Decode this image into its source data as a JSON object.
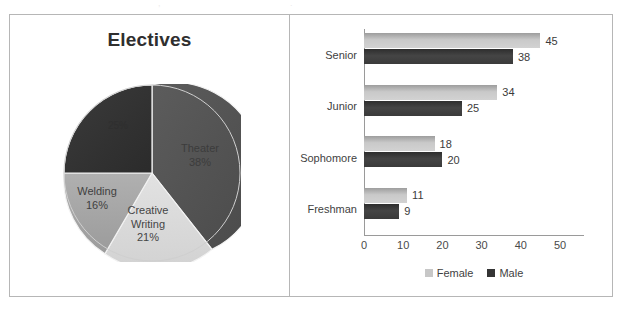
{
  "ghost_text": {
    "left": ",",
    "right": "."
  },
  "pie_panel": {
    "title": "Electives",
    "slices": [
      {
        "label": "Theater",
        "percent_text": "38%"
      },
      {
        "label": "Creative Writing",
        "label_line1": "Creative",
        "label_line2": "Writing",
        "percent_text": "21%"
      },
      {
        "label": "Welding",
        "percent_text": "16%"
      },
      {
        "label": "",
        "percent_text": "25%"
      }
    ]
  },
  "bar_panel": {
    "legend": [
      {
        "name": "Female",
        "color": "#c7c7c7"
      },
      {
        "name": "Male",
        "color": "#343434"
      }
    ],
    "xticks": [
      "0",
      "10",
      "20",
      "30",
      "40",
      "50"
    ]
  },
  "chart_data": [
    {
      "type": "pie",
      "title": "Electives",
      "labels": [
        "Theater",
        "Creative Writing",
        "Welding",
        "Band"
      ],
      "values": [
        38,
        21,
        16,
        25
      ],
      "value_suffix": "%",
      "label_texts": [
        "Theater 38%",
        "Creative Writing 21%",
        "Welding 16%",
        "25%"
      ],
      "colors": [
        "#535353",
        "#d9d9d9",
        "#a6a6a6",
        "#333333"
      ],
      "notes": "Fourth (darkest) slice label is illegible in the source image; it occupies the remaining 25%.",
      "legend": "none",
      "start_angle_deg": 0,
      "direction": "clockwise"
    },
    {
      "type": "bar",
      "orientation": "horizontal",
      "categories": [
        "Senior",
        "Junior",
        "Sophomore",
        "Freshman"
      ],
      "series": [
        {
          "name": "Female",
          "values": [
            45,
            34,
            18,
            11
          ],
          "color": "#c9c9c9"
        },
        {
          "name": "Male",
          "values": [
            38,
            25,
            20,
            9
          ],
          "color": "#3a3a3a"
        }
      ],
      "title": "",
      "xlabel": "",
      "ylabel": "",
      "xlim": [
        0,
        50
      ],
      "xticks": [
        0,
        10,
        20,
        30,
        40,
        50
      ],
      "grid": false,
      "data_labels": true,
      "legend_position": "bottom"
    }
  ]
}
